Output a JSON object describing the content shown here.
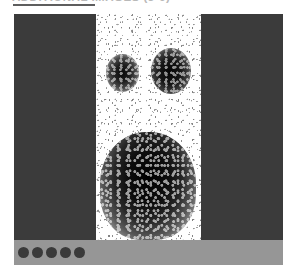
{
  "heading": {
    "text": "ADDITIONAL IMAGES (3-6)",
    "rule_color": "#5e5e5e",
    "text_color": "#b9b9b9"
  },
  "figure": {
    "panels": [
      {
        "name": "left-blank-panel",
        "kind": "blank",
        "fill": "#3b3b3b"
      },
      {
        "name": "center-scan-panel",
        "kind": "scan",
        "fill": "#ffffff"
      },
      {
        "name": "right-blank-panel",
        "kind": "blank",
        "fill": "#3b3b3b"
      }
    ],
    "scan": {
      "modality": "scintigraphy",
      "background": "#ffffff",
      "regions": [
        {
          "name": "upper-left-uptake",
          "label": "focal uptake"
        },
        {
          "name": "upper-right-uptake",
          "label": "focal uptake"
        },
        {
          "name": "lower-central-uptake",
          "label": "dense uptake"
        }
      ]
    }
  },
  "bottom_bar": {
    "background": "#969696",
    "dot_color": "#3a3a3a",
    "dots": [
      {
        "index": 1
      },
      {
        "index": 2
      },
      {
        "index": 3
      },
      {
        "index": 4
      },
      {
        "index": 5
      }
    ]
  }
}
